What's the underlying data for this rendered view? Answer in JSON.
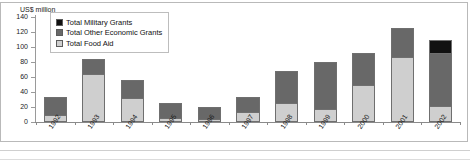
{
  "chart_data": {
    "type": "bar",
    "stacked": true,
    "title": "",
    "xlabel": "",
    "ylabel": "US$ million",
    "ylim": [
      0,
      140
    ],
    "yticks": [
      0,
      20,
      40,
      60,
      80,
      100,
      120,
      140
    ],
    "grid": false,
    "legend_position": "top-left-inside",
    "categories": [
      "1992",
      "1993",
      "1994",
      "1995",
      "1996",
      "1997",
      "1998",
      "1999",
      "2000",
      "2001",
      "2002"
    ],
    "series": [
      {
        "name": "Total Food Aid",
        "color": "#cfcfcf",
        "values": [
          7,
          65,
          32,
          3,
          2,
          12,
          24,
          16,
          49,
          87,
          20
        ]
      },
      {
        "name": "Total Other Economic Grants",
        "color": "#686868",
        "values": [
          26,
          19,
          24,
          22,
          18,
          21,
          44,
          64,
          43,
          38,
          72
        ]
      },
      {
        "name": "Total Military Grants",
        "color": "#111111",
        "values": [
          0,
          0,
          0,
          0,
          0,
          0,
          0,
          0,
          0,
          0,
          17
        ]
      }
    ],
    "totals": [
      33,
      84,
      56,
      25,
      20,
      33,
      68,
      80,
      92,
      125,
      109
    ]
  },
  "axis": {
    "unit_label": "US$ million"
  },
  "legend": {
    "items": [
      {
        "label": "Total Military Grants",
        "swatch": "#111111"
      },
      {
        "label": "Total Other Economic Grants",
        "swatch": "#686868"
      },
      {
        "label": "Total Food Aid",
        "swatch": "#cfcfcf"
      }
    ]
  }
}
